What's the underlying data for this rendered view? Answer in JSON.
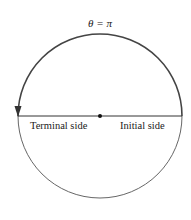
{
  "diagram": {
    "angle_label": "θ = π",
    "terminal_label": "Terminal side",
    "initial_label": "Initial side",
    "stroke_color": "#333333",
    "arc_color": "#444444"
  }
}
